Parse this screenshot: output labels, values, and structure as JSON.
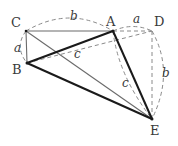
{
  "figure": {
    "type": "geometry-diagram",
    "caption": "",
    "background_color": "#ffffff",
    "solid_stroke_color": "#1a1a1a",
    "thin_stroke_color": "#6b6b6b",
    "dashed_stroke_color": "#8a8a8a",
    "label_color": "#3a3a3a",
    "vertices": [
      {
        "id": "C",
        "label": "C",
        "x": 26,
        "y": 31,
        "label_x": 11,
        "label_y": 16
      },
      {
        "id": "A",
        "label": "A",
        "x": 113,
        "y": 31,
        "label_x": 106,
        "label_y": 15
      },
      {
        "id": "D",
        "label": "D",
        "x": 152,
        "y": 31,
        "label_x": 154,
        "label_y": 15
      },
      {
        "id": "B",
        "label": "B",
        "x": 27,
        "y": 63,
        "label_x": 12,
        "label_y": 63
      },
      {
        "id": "E",
        "label": "E",
        "x": 152,
        "y": 119,
        "label_x": 150,
        "label_y": 124
      }
    ],
    "edge_labels": [
      {
        "id": "a-left",
        "text": "a",
        "x": 14,
        "y": 42
      },
      {
        "id": "b-top",
        "text": "b",
        "x": 70,
        "y": 10
      },
      {
        "id": "a-top",
        "text": "a",
        "x": 133,
        "y": 13
      },
      {
        "id": "c-mid",
        "text": "c",
        "x": 74,
        "y": 48
      },
      {
        "id": "c-right",
        "text": "c",
        "x": 122,
        "y": 77
      },
      {
        "id": "b-right",
        "text": "b",
        "x": 162,
        "y": 67
      }
    ],
    "solid_segments": [
      {
        "id": "B-A",
        "from": "B",
        "to": "A",
        "weight": "thick"
      },
      {
        "id": "B-E",
        "from": "B",
        "to": "E",
        "weight": "thick"
      },
      {
        "id": "A-E",
        "from": "A",
        "to": "E",
        "weight": "thick"
      },
      {
        "id": "C-A",
        "from": "C",
        "to": "A",
        "weight": "thin"
      },
      {
        "id": "C-B",
        "from": "C",
        "to": "B",
        "weight": "thin"
      },
      {
        "id": "C-E",
        "from": "C",
        "to": "E",
        "weight": "thin"
      },
      {
        "id": "B-C-short",
        "from": "B",
        "to": "C",
        "weight": "thin"
      }
    ],
    "dashed_segments": [
      {
        "id": "A-D",
        "from": "A",
        "to": "D"
      },
      {
        "id": "D-E",
        "from": "D",
        "to": "E"
      },
      {
        "id": "B-D",
        "from": "B",
        "to": "D"
      },
      {
        "id": "A-E-dashed",
        "from": "A",
        "to": "E"
      }
    ],
    "dashed_arcs": [
      {
        "id": "arc-C-A",
        "label": "b",
        "from": "C",
        "to": "A",
        "bulge": "up"
      },
      {
        "id": "arc-A-D",
        "label": "a",
        "from": "A",
        "to": "D",
        "bulge": "up"
      },
      {
        "id": "arc-C-B",
        "label": "a",
        "from": "C",
        "to": "B",
        "bulge": "left"
      },
      {
        "id": "arc-D-E",
        "label": "b",
        "from": "D",
        "to": "E",
        "bulge": "right"
      }
    ]
  }
}
